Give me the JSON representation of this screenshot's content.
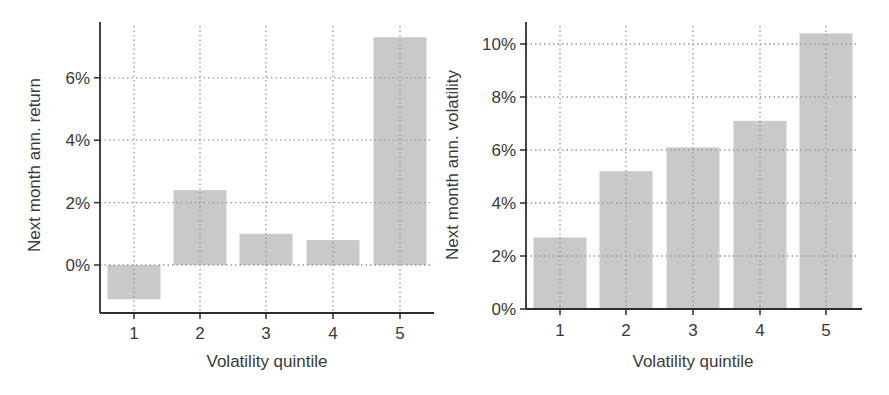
{
  "colors": {
    "bar": "#c9c9c9",
    "axis": "#2e2e2e",
    "grid": "#9a9a9a",
    "text": "#3a3a3a"
  },
  "chart_data": [
    {
      "type": "bar",
      "title": "",
      "xlabel": "Volatility quintile",
      "ylabel": "Next month ann. return",
      "categories": [
        "1",
        "2",
        "3",
        "4",
        "5"
      ],
      "values": [
        -1.1,
        2.4,
        1.0,
        0.8,
        7.3
      ],
      "unit": "%",
      "yticks": [
        0,
        2,
        4,
        6
      ],
      "ytick_labels": [
        "0%",
        "2%",
        "4%",
        "6%"
      ],
      "ylim": [
        -1.5,
        7.5
      ],
      "grid": true,
      "legend": null
    },
    {
      "type": "bar",
      "title": "",
      "xlabel": "Volatility quintile",
      "ylabel": "Next month ann. volatility",
      "categories": [
        "1",
        "2",
        "3",
        "4",
        "5"
      ],
      "values": [
        2.7,
        5.2,
        6.1,
        7.1,
        10.4
      ],
      "unit": "%",
      "yticks": [
        0,
        2,
        4,
        6,
        8,
        10
      ],
      "ytick_labels": [
        "0%",
        "2%",
        "4%",
        "6%",
        "8%",
        "10%"
      ],
      "ylim": [
        0,
        10.8
      ],
      "grid": true,
      "legend": null
    }
  ]
}
